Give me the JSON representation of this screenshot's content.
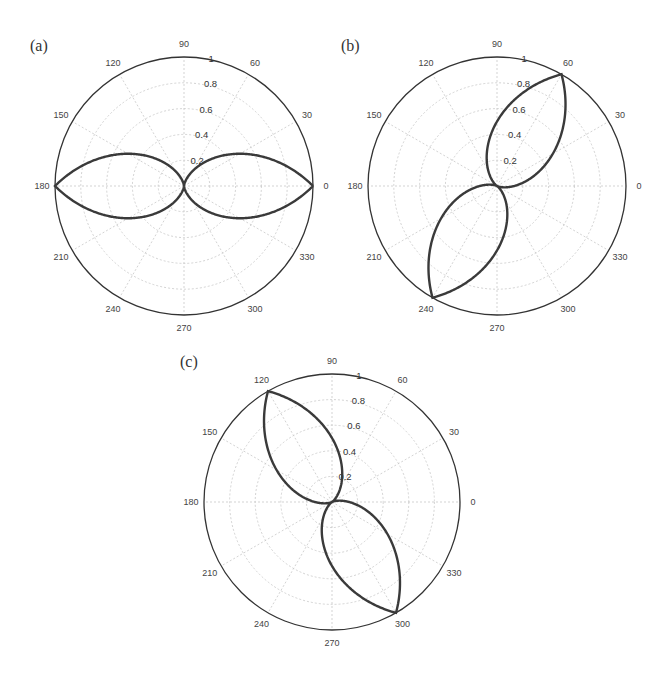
{
  "chart_data": [
    {
      "type": "polar-line",
      "label": "(a)",
      "center": [
        184,
        186
      ],
      "radius": 129,
      "peak_angle_deg": 0,
      "formula": "r = 1 - |sin(theta - 0deg)|",
      "angle_ticks": [
        "0",
        "30",
        "60",
        "90",
        "120",
        "150",
        "180",
        "210",
        "240",
        "270",
        "300",
        "330"
      ],
      "radial_ticks": [
        "0.2",
        "0.4",
        "0.6",
        "0.8",
        "1"
      ],
      "rlim": [
        0,
        1
      ],
      "series": [
        {
          "name": "pattern-a",
          "peak_directions_deg": [
            0,
            180
          ],
          "nulls_deg": [
            90,
            270
          ],
          "max_r": 1
        }
      ],
      "grid": true
    },
    {
      "type": "polar-line",
      "label": "(b)",
      "center": [
        497,
        186
      ],
      "radius": 129,
      "peak_angle_deg": 60,
      "formula": "r = 1 - |sin(theta - 60deg)|",
      "angle_ticks": [
        "0",
        "30",
        "60",
        "90",
        "120",
        "150",
        "180",
        "210",
        "240",
        "270",
        "300",
        "330"
      ],
      "radial_ticks": [
        "0.2",
        "0.4",
        "0.6",
        "0.8",
        "1"
      ],
      "rlim": [
        0,
        1
      ],
      "series": [
        {
          "name": "pattern-b",
          "peak_directions_deg": [
            60,
            240
          ],
          "nulls_deg": [
            150,
            330
          ],
          "max_r": 1
        }
      ],
      "grid": true
    },
    {
      "type": "polar-line",
      "label": "(c)",
      "center": [
        332,
        502
      ],
      "radius": 128,
      "peak_angle_deg": 120,
      "formula": "r = 1 - |sin(theta - 120deg)|",
      "angle_ticks": [
        "0",
        "30",
        "60",
        "90",
        "120",
        "150",
        "180",
        "210",
        "240",
        "270",
        "300",
        "330"
      ],
      "radial_ticks": [
        "0.2",
        "0.4",
        "0.6",
        "0.8",
        "1"
      ],
      "rlim": [
        0,
        1
      ],
      "series": [
        {
          "name": "pattern-c",
          "peak_directions_deg": [
            120,
            300
          ],
          "nulls_deg": [
            30,
            210
          ],
          "max_r": 1
        }
      ],
      "grid": true
    }
  ],
  "labels": {
    "a": "(a)",
    "b": "(b)",
    "c": "(c)"
  },
  "colors": {
    "curve": "#3a3a3a",
    "grid": "#c8c8c8",
    "frame": "#333333"
  }
}
